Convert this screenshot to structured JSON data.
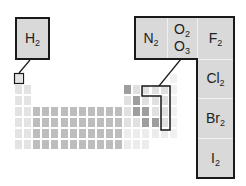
{
  "colors": {
    "box_fill": "#d9d9d9",
    "outline": "#1a1a1a",
    "grid_light": "#ececec",
    "grid_s_block": "#e3e3e3",
    "grid_d_block": "#bdbdbd",
    "grid_p_block": "#e0e0e0",
    "grid_metalloid": "#9e9e9e",
    "grid_noble": "#f1f1f1"
  },
  "callouts": {
    "hydrogen": {
      "symbol": "H",
      "subscript": "2"
    },
    "nitrogen": {
      "symbol": "N",
      "subscript": "2"
    },
    "oxygen": [
      {
        "symbol": "O",
        "subscript": "2"
      },
      {
        "symbol": "O",
        "subscript": "3"
      }
    ],
    "fluorine": {
      "symbol": "F",
      "subscript": "2"
    },
    "chlorine": {
      "symbol": "Cl",
      "subscript": "2"
    },
    "bromine": {
      "symbol": "Br",
      "subscript": "2"
    },
    "iodine": {
      "symbol": "I",
      "subscript": "2"
    }
  },
  "periodic_table": {
    "columns": 18,
    "rows": 7,
    "highlighted_elements": [
      "H",
      "N",
      "O",
      "F",
      "Cl",
      "Br",
      "I"
    ],
    "metalloid_cells": [
      [
        13,
        2
      ],
      [
        14,
        3
      ],
      [
        14,
        4
      ],
      [
        15,
        4
      ],
      [
        15,
        5
      ],
      [
        16,
        5
      ]
    ]
  }
}
